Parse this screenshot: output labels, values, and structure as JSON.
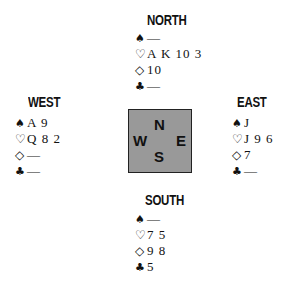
{
  "hands": {
    "north": {
      "label": "NORTH",
      "spades": "—",
      "hearts": "A K 10 3",
      "diamonds": "10",
      "clubs": "—"
    },
    "west": {
      "label": "WEST",
      "spades": "A 9",
      "hearts": "Q 8 2",
      "diamonds": "—",
      "clubs": "—"
    },
    "east": {
      "label": "EAST",
      "spades": "J",
      "hearts": "J 9 6",
      "diamonds": "7",
      "clubs": "—"
    },
    "south": {
      "label": "SOUTH",
      "spades": "—",
      "hearts": "7 5",
      "diamonds": "9 8",
      "clubs": "5"
    }
  },
  "suits": {
    "spades": "♠",
    "hearts": "♡",
    "diamonds": "◇",
    "clubs": "♣"
  },
  "compass": {
    "n": "N",
    "w": "W",
    "e": "E",
    "s": "S",
    "fill": "#999999"
  }
}
